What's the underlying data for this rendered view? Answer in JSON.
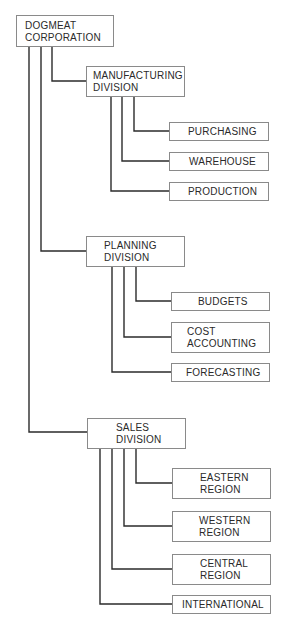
{
  "diagram": {
    "type": "org-chart",
    "root": {
      "label": "DOGMEAT\nCORPORATION",
      "box": [
        16,
        15,
        98,
        32
      ]
    },
    "divisions": [
      {
        "label": "MANUFACTURING\nDIVISION",
        "box": [
          86,
          66,
          99,
          31
        ],
        "children": [
          {
            "label": "PURCHASING",
            "box": [
              169,
              122,
              100,
              19
            ]
          },
          {
            "label": "WAREHOUSE",
            "box": [
              169,
              152,
              100,
              19
            ]
          },
          {
            "label": "PRODUCTION",
            "box": [
              169,
              182,
              100,
              19
            ]
          }
        ]
      },
      {
        "label": "PLANNING\nDIVISION",
        "box": [
          86,
          236,
          99,
          31
        ],
        "children": [
          {
            "label": "BUDGETS",
            "box": [
              171,
              292,
              99,
              19
            ]
          },
          {
            "label": "COST\nACCOUNTING",
            "box": [
              171,
              322,
              99,
              31
            ]
          },
          {
            "label": "FORECASTING",
            "box": [
              171,
              363,
              99,
              19
            ]
          }
        ]
      },
      {
        "label": "SALES\nDIVISION",
        "box": [
          87,
          418,
          99,
          31
        ],
        "children": [
          {
            "label": "EASTERN\nREGION",
            "box": [
              172,
              468,
              99,
              31
            ]
          },
          {
            "label": "WESTERN\nREGION",
            "box": [
              172,
              511,
              99,
              31
            ]
          },
          {
            "label": "CENTRAL\nREGION",
            "box": [
              172,
              554,
              99,
              31
            ]
          },
          {
            "label": "INTERNATIONAL",
            "box": [
              172,
              595,
              99,
              19
            ]
          }
        ]
      }
    ],
    "colors": {
      "line": "#2b2b2b",
      "box_border": "#8a8a8a",
      "text": "#2a2a2a",
      "background": "#ffffff"
    }
  }
}
